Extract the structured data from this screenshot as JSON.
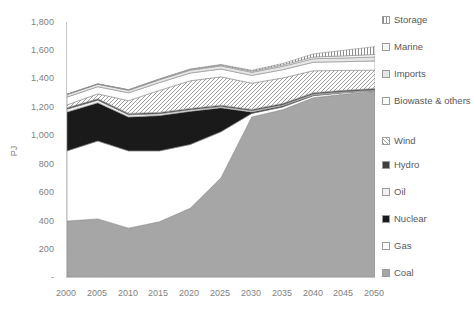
{
  "chart_data": {
    "type": "area",
    "stacked": true,
    "title": "",
    "xlabel": "",
    "ylabel": "PJ",
    "x": [
      2000,
      2005,
      2010,
      2015,
      2020,
      2025,
      2030,
      2035,
      2040,
      2045,
      2050
    ],
    "xtick_labels": [
      "2000",
      "2005",
      "2010",
      "2015",
      "2020",
      "2025",
      "2030",
      "2035",
      "2040",
      "2045",
      "2050"
    ],
    "ytick_labels": [
      "-",
      "200",
      "400",
      "600",
      "800",
      "1,000",
      "1,200",
      "1,400",
      "1,600",
      "1,800"
    ],
    "ylim": [
      0,
      1800
    ],
    "ytick_step": 200,
    "grid": false,
    "legend_position": "right",
    "series": [
      {
        "name": "Coal",
        "color": "#a6a6a6",
        "pattern": "solid",
        "values": [
          395,
          410,
          345,
          390,
          485,
          700,
          1130,
          1180,
          1265,
          1290,
          1310
        ]
      },
      {
        "name": "Gas",
        "color": "#ffffff",
        "pattern": "solid",
        "values": [
          495,
          550,
          545,
          500,
          450,
          325,
          25,
          20,
          15,
          10,
          5
        ]
      },
      {
        "name": "Nuclear",
        "color": "#1a1a1a",
        "pattern": "solid",
        "values": [
          275,
          270,
          240,
          250,
          235,
          170,
          10,
          8,
          5,
          3,
          0
        ]
      },
      {
        "name": "Oil",
        "color": "#f2f2f2",
        "pattern": "solid",
        "values": [
          20,
          18,
          15,
          12,
          10,
          8,
          8,
          7,
          6,
          5,
          5
        ]
      },
      {
        "name": "Hydro",
        "color": "#404040",
        "pattern": "solid",
        "values": [
          10,
          10,
          10,
          10,
          10,
          10,
          10,
          10,
          10,
          10,
          10
        ]
      },
      {
        "name": "Wind",
        "color": "#d9d9d9",
        "pattern": "diag-hatch",
        "values": [
          20,
          35,
          90,
          155,
          195,
          200,
          185,
          180,
          155,
          140,
          130
        ]
      },
      {
        "name": "Biowaste & others",
        "color": "#ffffff",
        "pattern": "solid",
        "values": [
          55,
          50,
          55,
          55,
          55,
          55,
          55,
          58,
          60,
          62,
          65
        ]
      },
      {
        "name": "Imports",
        "color": "#e6e6e6",
        "pattern": "solid",
        "values": [
          18,
          18,
          18,
          20,
          20,
          22,
          22,
          24,
          25,
          26,
          28
        ]
      },
      {
        "name": "Marine",
        "color": "#f7f7f7",
        "pattern": "solid",
        "values": [
          2,
          2,
          3,
          4,
          5,
          6,
          8,
          10,
          12,
          15,
          18
        ]
      },
      {
        "name": "Storage",
        "color": "#bfbfbf",
        "pattern": "vert-hatch",
        "values": [
          0,
          0,
          1,
          2,
          3,
          4,
          6,
          10,
          22,
          40,
          55
        ]
      }
    ],
    "legend_order": [
      "Storage",
      "Marine",
      "Imports",
      "Biowaste & others",
      "Wind",
      "Hydro",
      "Oil",
      "Nuclear",
      "Gas",
      "Coal"
    ],
    "axis_color": "#c9c9c9",
    "tick_text_color": "#7f7f7f"
  }
}
